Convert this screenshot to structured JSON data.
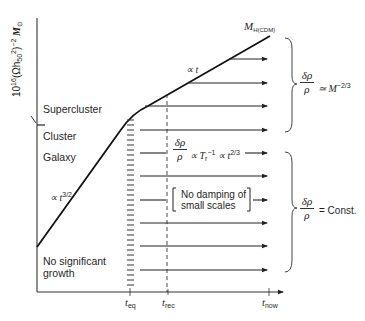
{
  "diagram": {
    "y_axis_label": {
      "prefix": "10",
      "exp": "16",
      "mid": "(Ωh",
      "sub": "50",
      "sup2": "2",
      "close": ")",
      "exp2": "−2",
      "m": "M",
      "msub": "⊙"
    },
    "region_labels": {
      "supercluster": "Supercluster",
      "cluster": "Cluster",
      "galaxy": "Galaxy",
      "no_growth_line1": "No significant",
      "no_growth_line2": "growth"
    },
    "curve_labels": {
      "early_slope": "∝ t",
      "early_slope_exp": "3/2",
      "late_slope": "∝ t",
      "horizon_mass": "M",
      "horizon_mass_sub": "H(CDM)"
    },
    "growth_label": {
      "num": "δρ",
      "den": "ρ",
      "rhs": "∝ T",
      "rhs_sub": "r",
      "rhs_sup": "−1",
      "rhs2": "∝ t",
      "rhs2_sup": "2/3"
    },
    "damping_note": {
      "line1": "No damping of",
      "line2": "small scales"
    },
    "right_brackets": {
      "upper": {
        "num": "δρ",
        "den": "ρ",
        "rhs": "≃ M",
        "rhs_sup": "−2/3"
      },
      "lower": {
        "num": "δρ",
        "den": "ρ",
        "rhs": "= Const."
      }
    },
    "x_ticks": [
      {
        "t": "t",
        "sub": "eq"
      },
      {
        "t": "t",
        "sub": "rec"
      },
      {
        "t": "t",
        "sub": "now"
      }
    ],
    "arrow_rows_y": [
      59,
      83,
      106,
      130,
      153,
      176,
      200,
      223,
      246,
      270
    ]
  }
}
